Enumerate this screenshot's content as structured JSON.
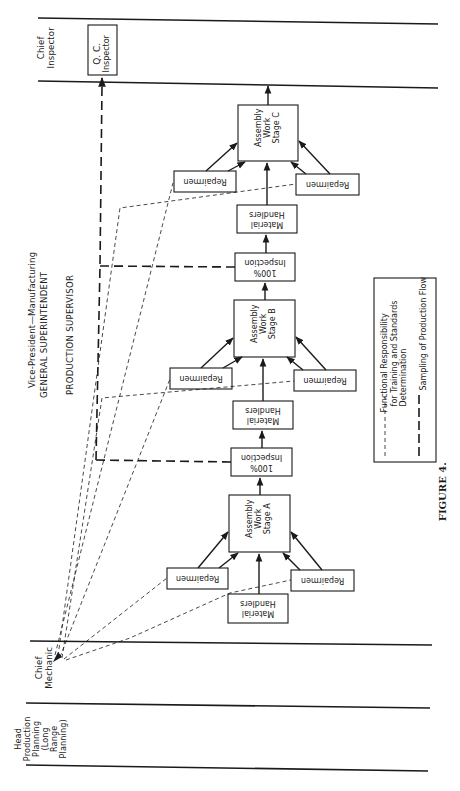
{
  "figure": {
    "caption": "FIGURE 4.",
    "orientation": "rotated 90° counter-clockwise"
  },
  "swimlanes": {
    "chief_inspector": {
      "label_l1": "Chief",
      "label_l2": "Inspector"
    },
    "chief_mechanic": {
      "label_l1": "Chief",
      "label_l2": "Mechanic"
    },
    "head_production_planning": {
      "label_l1": "Head",
      "label_l2": "Production",
      "label_l3": "Planning",
      "label_l4": "(Long",
      "label_l5": "Range",
      "label_l6": "Planning)"
    }
  },
  "hierarchy": {
    "vp": "Vice-President—Manufacturing",
    "general_superintendent": "GENERAL SUPERINTENDENT",
    "production_supervisor": "PRODUCTION SUPERVISOR"
  },
  "nodes": {
    "qc_inspector": {
      "l1": "Q. C.",
      "l2": "Inspector"
    },
    "stage_a": {
      "l1": "Assembly",
      "l2": "Work",
      "l3": "Stage  A"
    },
    "stage_b": {
      "l1": "Assembly",
      "l2": "Work",
      "l3": "Stage  B"
    },
    "stage_c": {
      "l1": "Assembly",
      "l2": "Work",
      "l3": "Stage  C"
    },
    "inspection_1": {
      "l1": "100%",
      "l2": "Inspection"
    },
    "inspection_2": {
      "l1": "100%",
      "l2": "Inspection"
    },
    "material_handlers_a": {
      "l1": "Material",
      "l2": "Handlers"
    },
    "material_handlers_b": {
      "l1": "Material",
      "l2": "Handlers"
    },
    "material_handlers_c": {
      "l1": "Material",
      "l2": "Handlers"
    },
    "repairmen_label": "Repairmen"
  },
  "legend": {
    "dashed_thin": {
      "l1": "Functional Responsibility",
      "l2": "for Training and Standards",
      "l3": "Determination"
    },
    "dashed_thick": {
      "l1": "Sampling of Production Flow"
    }
  },
  "colors": {
    "ink": "#1a1a1a",
    "background": "#ffffff"
  }
}
